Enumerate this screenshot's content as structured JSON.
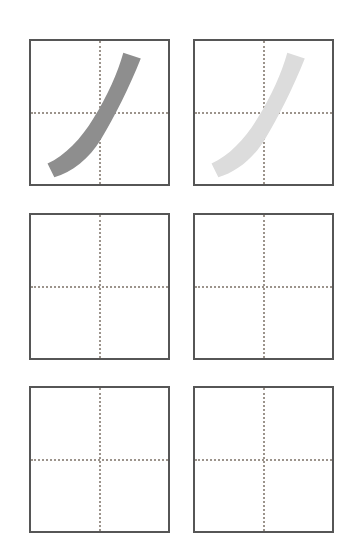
{
  "worksheet": {
    "title": "Chinese character stroke practice worksheet",
    "description": "Six square practice grids arranged in three rows of two, each with dotted center crosshair guides.",
    "background_color": "#ffffff",
    "grid": {
      "rows": 3,
      "columns": 2,
      "cell_width_px": 141,
      "cell_height_px": 147,
      "border_color": "#565656",
      "border_width_px": 2,
      "guide_color": "#9c948c",
      "guide_style": "dotted",
      "guide_width_px": 2,
      "cell_background": "#ffffff"
    },
    "cells": [
      {
        "id": "cell-r1c1",
        "row": 1,
        "column": 1,
        "label": "Row 1 Column 1",
        "content": "stroke",
        "stroke_name": "pie",
        "stroke_label": "撇",
        "stroke_color": "#8e8e8e",
        "stroke_opacity": "1"
      },
      {
        "id": "cell-r1c2",
        "row": 1,
        "column": 2,
        "label": "Row 1 Column 2",
        "content": "stroke",
        "stroke_name": "pie",
        "stroke_label": "撇",
        "stroke_color": "#dcdcdc",
        "stroke_opacity": "1"
      },
      {
        "id": "cell-r2c1",
        "row": 2,
        "column": 1,
        "label": "Row 2 Column 1",
        "content": "empty",
        "stroke_name": "",
        "stroke_label": "",
        "stroke_color": "",
        "stroke_opacity": "0"
      },
      {
        "id": "cell-r2c2",
        "row": 2,
        "column": 2,
        "label": "Row 2 Column 2",
        "content": "empty",
        "stroke_name": "",
        "stroke_label": "",
        "stroke_color": "",
        "stroke_opacity": "0"
      },
      {
        "id": "cell-r3c1",
        "row": 3,
        "column": 1,
        "label": "Row 3 Column 1",
        "content": "empty",
        "stroke_name": "",
        "stroke_label": "",
        "stroke_color": "",
        "stroke_opacity": "0"
      },
      {
        "id": "cell-r3c2",
        "row": 3,
        "column": 2,
        "label": "Row 3 Column 2",
        "content": "empty",
        "stroke_name": "",
        "stroke_label": "",
        "stroke_color": "",
        "stroke_opacity": "0"
      }
    ],
    "stroke_path": "M 95 12 L 113 18 C 101 48 86 78 72 101 C 60 121 42 135 24 140 L 17 126 C 35 118 52 100 64 80 C 79 56 89 33 95 12 Z"
  }
}
